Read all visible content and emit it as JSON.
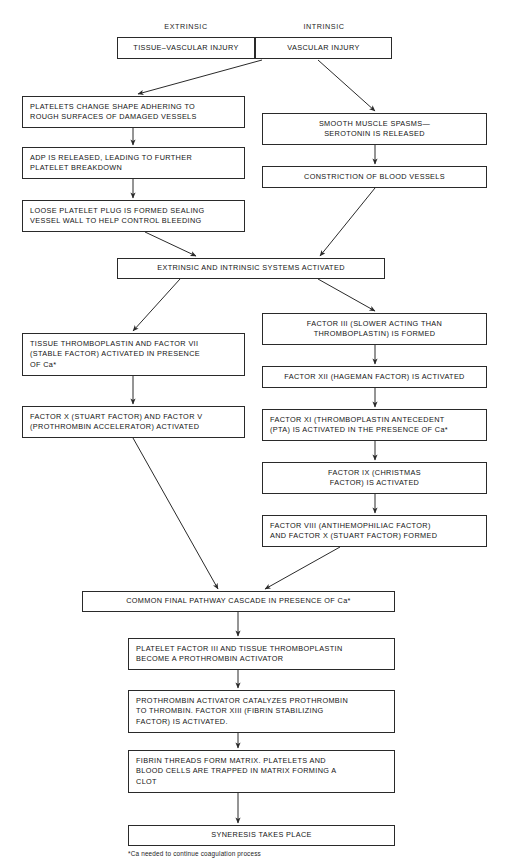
{
  "diagram": {
    "column_headers": [
      {
        "id": "extrinsic",
        "label": "EXTRINSIC",
        "x": 117,
        "y": 22,
        "w": 138
      },
      {
        "id": "intrinsic",
        "label": "INTRINSIC",
        "x": 255,
        "y": 22,
        "w": 138
      }
    ],
    "footnote": "*Ca needed to continue coagulation process",
    "nodes": [
      {
        "id": "tissue-vascular-injury",
        "lines": [
          "TISSUE–VASCULAR INJURY"
        ],
        "x": 117,
        "y": 37,
        "w": 138,
        "h": 22,
        "align": "center"
      },
      {
        "id": "vascular-injury",
        "lines": [
          "VASCULAR INJURY"
        ],
        "x": 255,
        "y": 37,
        "w": 137,
        "h": 22,
        "align": "center"
      },
      {
        "id": "platelets-change-shape",
        "lines": [
          "PLATELETS CHANGE SHAPE ADHERING TO",
          "ROUGH SURFACES OF DAMAGED VESSELS"
        ],
        "x": 22,
        "y": 96,
        "w": 223,
        "h": 32,
        "align": "left"
      },
      {
        "id": "adp-released",
        "lines": [
          "ADP IS RELEASED, LEADING TO FURTHER",
          "PLATELET BREAKDOWN"
        ],
        "x": 22,
        "y": 147,
        "w": 223,
        "h": 32,
        "align": "left"
      },
      {
        "id": "loose-platelet-plug",
        "lines": [
          "LOOSE PLATELET PLUG IS FORMED SEALING",
          "VESSEL WALL TO HELP CONTROL BLEEDING"
        ],
        "x": 22,
        "y": 200,
        "w": 223,
        "h": 32,
        "align": "left"
      },
      {
        "id": "smooth-muscle-spasms",
        "lines": [
          "SMOOTH MUSCLE SPASMS—",
          "SEROTONIN IS RELEASED"
        ],
        "x": 262,
        "y": 113,
        "w": 225,
        "h": 32,
        "align": "center"
      },
      {
        "id": "constriction-blood-vessels",
        "lines": [
          "CONSTRICTION OF BLOOD VESSELS"
        ],
        "x": 262,
        "y": 166,
        "w": 225,
        "h": 22,
        "align": "center"
      },
      {
        "id": "extrinsic-intrinsic-activated",
        "lines": [
          "EXTRINSIC AND INTRINSIC SYSTEMS ACTIVATED"
        ],
        "x": 117,
        "y": 258,
        "w": 268,
        "h": 21,
        "align": "center"
      },
      {
        "id": "tissue-thromboplastin-factor-vii",
        "lines": [
          "TISSUE THROMBOPLASTIN AND FACTOR VII",
          "(STABLE FACTOR) ACTIVATED IN PRESENCE",
          "OF Ca*"
        ],
        "x": 22,
        "y": 333,
        "w": 223,
        "h": 43,
        "align": "left"
      },
      {
        "id": "factor-x-and-factor-v",
        "lines": [
          "FACTOR X (STUART FACTOR) AND FACTOR V",
          "(PROTHROMBIN ACCELERATOR) ACTIVATED"
        ],
        "x": 22,
        "y": 406,
        "w": 223,
        "h": 32,
        "align": "left"
      },
      {
        "id": "factor-iii-formed",
        "lines": [
          "FACTOR III (SLOWER ACTING THAN",
          "THROMBOPLASTIN) IS FORMED"
        ],
        "x": 262,
        "y": 313,
        "w": 225,
        "h": 32,
        "align": "center"
      },
      {
        "id": "factor-xii-activated",
        "lines": [
          "FACTOR XII (HAGEMAN FACTOR) IS ACTIVATED"
        ],
        "x": 262,
        "y": 366,
        "w": 225,
        "h": 22,
        "align": "center"
      },
      {
        "id": "factor-xi-activated",
        "lines": [
          "FACTOR XI (THROMBOPLASTIN ANTECEDENT",
          "(PTA) IS ACTIVATED IN THE PRESENCE OF Ca*"
        ],
        "x": 262,
        "y": 409,
        "w": 225,
        "h": 32,
        "align": "left"
      },
      {
        "id": "factor-ix-activated",
        "lines": [
          "FACTOR IX (CHRISTMAS",
          "FACTOR) IS ACTIVATED"
        ],
        "x": 262,
        "y": 462,
        "w": 225,
        "h": 32,
        "align": "center"
      },
      {
        "id": "factor-viii-and-factor-x-formed",
        "lines": [
          "FACTOR VIII (ANTIHEMOPHILIAC FACTOR)",
          "AND FACTOR X (STUART FACTOR) FORMED"
        ],
        "x": 262,
        "y": 515,
        "w": 225,
        "h": 32,
        "align": "left"
      },
      {
        "id": "common-final-pathway",
        "lines": [
          "COMMON FINAL  PATHWAY CASCADE  IN PRESENCE OF Ca*"
        ],
        "x": 82,
        "y": 591,
        "w": 313,
        "h": 21,
        "align": "center"
      },
      {
        "id": "platelet-factor-iii",
        "lines": [
          "PLATELET FACTOR III AND TISSUE THROMBOPLASTIN",
          "BECOME A PROTHROMBIN ACTIVATOR"
        ],
        "x": 128,
        "y": 638,
        "w": 267,
        "h": 32,
        "align": "left"
      },
      {
        "id": "prothrombin-activator-catalyzes",
        "lines": [
          "PROTHROMBIN ACTIVATOR CATALYZES PROTHROMBIN",
          "TO THROMBIN. FACTOR XIII (FIBRIN STABILIZING",
          "FACTOR) IS ACTIVATED."
        ],
        "x": 128,
        "y": 690,
        "w": 267,
        "h": 43,
        "align": "left"
      },
      {
        "id": "fibrin-threads-form-matrix",
        "lines": [
          "FIBRIN THREADS FORM MATRIX. PLATELETS AND",
          "BLOOD CELLS ARE TRAPPED IN MATRIX FORMING A",
          "CLOT"
        ],
        "x": 128,
        "y": 750,
        "w": 267,
        "h": 43,
        "align": "left"
      },
      {
        "id": "syneresis-takes-place",
        "lines": [
          "SYNERESIS TAKES PLACE"
        ],
        "x": 128,
        "y": 825,
        "w": 267,
        "h": 21,
        "align": "center"
      }
    ],
    "edges": [
      {
        "id": "edge-vascular-to-platelets",
        "from": "vascular-injury",
        "to": "platelets-change-shape",
        "path": "M 262,60 L 138,94"
      },
      {
        "id": "edge-vascular-to-spasms",
        "from": "vascular-injury",
        "to": "smooth-muscle-spasms",
        "path": "M 318,60 L 375,111"
      },
      {
        "id": "edge-platelets-to-adp",
        "from": "platelets-change-shape",
        "to": "adp-released",
        "path": "M 133,128 L 133,145"
      },
      {
        "id": "edge-adp-to-plug",
        "from": "adp-released",
        "to": "loose-platelet-plug",
        "path": "M 133,179 L 133,198"
      },
      {
        "id": "edge-spasms-to-constriction",
        "from": "smooth-muscle-spasms",
        "to": "constriction-blood-vessels",
        "path": "M 375,145 L 375,164"
      },
      {
        "id": "edge-plug-to-systems",
        "from": "loose-platelet-plug",
        "to": "extrinsic-intrinsic-activated",
        "path": "M 145,232 L 196,256"
      },
      {
        "id": "edge-constriction-to-systems",
        "from": "constriction-blood-vessels",
        "to": "extrinsic-intrinsic-activated",
        "path": "M 375,188 L 320,256"
      },
      {
        "id": "edge-systems-to-tissue-thromb",
        "from": "extrinsic-intrinsic-activated",
        "to": "tissue-thromboplastin-factor-vii",
        "path": "M 180,279 L 133,331"
      },
      {
        "id": "edge-systems-to-factor-iii",
        "from": "extrinsic-intrinsic-activated",
        "to": "factor-iii-formed",
        "path": "M 318,279 L 375,311"
      },
      {
        "id": "edge-tissue-to-factor-x",
        "from": "tissue-thromboplastin-factor-vii",
        "to": "factor-x-and-factor-v",
        "path": "M 133,376 L 133,404"
      },
      {
        "id": "edge-factoriii-to-factorxii",
        "from": "factor-iii-formed",
        "to": "factor-xii-activated",
        "path": "M 375,345 L 375,364"
      },
      {
        "id": "edge-factorxii-to-factorxi",
        "from": "factor-xii-activated",
        "to": "factor-xi-activated",
        "path": "M 375,388 L 375,407"
      },
      {
        "id": "edge-factorxi-to-factorix",
        "from": "factor-xi-activated",
        "to": "factor-ix-activated",
        "path": "M 375,441 L 375,460"
      },
      {
        "id": "edge-factorix-to-factorviii",
        "from": "factor-ix-activated",
        "to": "factor-viii-and-factor-x-formed",
        "path": "M 375,494 L 375,513"
      },
      {
        "id": "edge-factorx-to-common",
        "from": "factor-x-and-factor-v",
        "to": "common-final-pathway",
        "path": "M 133,438 L 218,589"
      },
      {
        "id": "edge-factorviii-to-common",
        "from": "factor-viii-and-factor-x-formed",
        "to": "common-final-pathway",
        "path": "M 340,547 L 265,589"
      },
      {
        "id": "edge-common-to-pf3",
        "from": "common-final-pathway",
        "to": "platelet-factor-iii",
        "path": "M 238,612 L 238,636"
      },
      {
        "id": "edge-pf3-to-prothrombin",
        "from": "platelet-factor-iii",
        "to": "prothrombin-activator-catalyzes",
        "path": "M 238,670 L 238,688"
      },
      {
        "id": "edge-prothrombin-to-fibrin",
        "from": "prothrombin-activator-catalyzes",
        "to": "fibrin-threads-form-matrix",
        "path": "M 238,733 L 238,748"
      },
      {
        "id": "edge-fibrin-to-syneresis",
        "from": "fibrin-threads-form-matrix",
        "to": "syneresis-takes-place",
        "path": "M 238,793 L 238,823"
      }
    ]
  }
}
